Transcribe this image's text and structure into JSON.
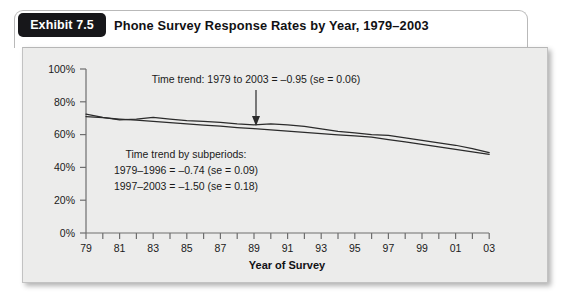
{
  "exhibit": {
    "tab_label": "Exhibit 7.5",
    "title": "Phone Survey Response Rates by Year, 1979–2003"
  },
  "annotations": {
    "overall_trend": "Time trend: 1979 to 2003 = –0.95 (se = 0.06)",
    "subperiod_header": "Time trend by subperiods:",
    "subperiod_1": "1979–1996 = –0.74 (se = 0.09)",
    "subperiod_2": "1997–2003 = –1.50 (se = 0.18)",
    "arrow_icon": "down-arrow-icon"
  },
  "axes": {
    "x_title": "Year of Survey",
    "y_ticks": [
      "0%",
      "20%",
      "40%",
      "60%",
      "80%",
      "100%"
    ],
    "x_ticks": [
      "79",
      "81",
      "83",
      "85",
      "87",
      "89",
      "91",
      "93",
      "95",
      "97",
      "99",
      "01",
      "03"
    ]
  },
  "colors": {
    "tab_background": "#17171a",
    "tab_text": "#ffffff",
    "panel_background": "#ececeb",
    "line": "#2b2b2b",
    "axis": "#6e6e6e",
    "text": "#1a1a1a"
  },
  "chart_data": {
    "type": "line",
    "title": "Phone Survey Response Rates by Year, 1979–2003",
    "xlabel": "Year of Survey",
    "ylabel": "",
    "xlim": [
      1979,
      2003
    ],
    "ylim": [
      0,
      100
    ],
    "grid": false,
    "legend": "none",
    "x": [
      1979,
      1980,
      1981,
      1982,
      1983,
      1984,
      1985,
      1986,
      1987,
      1988,
      1989,
      1990,
      1991,
      1992,
      1993,
      1994,
      1995,
      1996,
      1997,
      1998,
      1999,
      2000,
      2001,
      2002,
      2003
    ],
    "series": [
      {
        "name": "Response rate",
        "values": [
          72.5,
          70.5,
          69.0,
          69.5,
          70.5,
          69.5,
          68.5,
          68.0,
          67.5,
          66.5,
          66.0,
          66.5,
          66.0,
          65.0,
          63.5,
          62.0,
          61.0,
          60.0,
          59.5,
          58.0,
          56.5,
          55.0,
          53.5,
          51.5,
          49.0
        ]
      },
      {
        "name": "Fitted trend",
        "values": [
          71.0,
          70.3,
          69.5,
          68.8,
          68.0,
          67.3,
          66.6,
          65.8,
          65.1,
          64.3,
          63.6,
          62.9,
          62.1,
          61.4,
          60.6,
          59.9,
          59.2,
          58.4,
          57.0,
          55.5,
          54.0,
          52.5,
          51.0,
          49.5,
          48.0
        ]
      }
    ],
    "annotations": [
      {
        "text": "Time trend: 1979 to 2003 = –0.95 (se = 0.06)",
        "x": 1989,
        "y": 92
      },
      {
        "text": "Time trend by subperiods:",
        "x": 1986,
        "y": 42
      },
      {
        "text": "1979–1996 = –0.74 (se = 0.09)",
        "x": 1986,
        "y": 34
      },
      {
        "text": "1997–2003 = –1.50 (se = 0.18)",
        "x": 1986,
        "y": 26
      }
    ]
  }
}
